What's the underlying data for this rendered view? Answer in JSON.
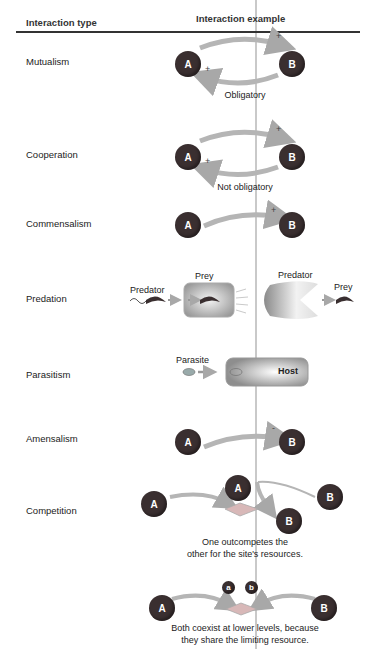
{
  "header": {
    "col1": "Interaction type",
    "col2": "Interaction example"
  },
  "rows": [
    {
      "type": "Mutualism",
      "caption": "Obligatory",
      "signs": [
        "+",
        "+"
      ],
      "nodes": [
        "A",
        "B"
      ]
    },
    {
      "type": "Cooperation",
      "caption": "Not obligatory",
      "signs": [
        "+",
        "+"
      ],
      "nodes": [
        "A",
        "B"
      ]
    },
    {
      "type": "Commensalism",
      "signs": [
        "+"
      ],
      "nodes": [
        "A",
        "B"
      ]
    },
    {
      "type": "Predation",
      "labels": {
        "predator_left": "Predator",
        "prey_left": "Prey",
        "predator_right": "Predator",
        "prey_right": "Prey"
      }
    },
    {
      "type": "Parasitism",
      "labels": {
        "parasite": "Parasite",
        "host": "Host"
      }
    },
    {
      "type": "Amensalism",
      "signs": [
        "-"
      ],
      "nodes": [
        "A",
        "B"
      ]
    },
    {
      "type": "Competition",
      "caption_1": "One outcompetes the",
      "caption_2": "other for the site's resources.",
      "nodes": [
        "A",
        "A",
        "B",
        "B"
      ]
    },
    {
      "coexist": true,
      "caption_1": "Both coexist at lower levels, because",
      "caption_2": "they share the limiting resource.",
      "nodes": [
        "A",
        "B"
      ],
      "small_nodes": [
        "a",
        "b"
      ]
    }
  ],
  "colors": {
    "node": "#3a2f30",
    "arrow": "#b5b5b5",
    "rule": "#333333",
    "host": "#9a9a9a",
    "site": "#c8a8a8"
  }
}
